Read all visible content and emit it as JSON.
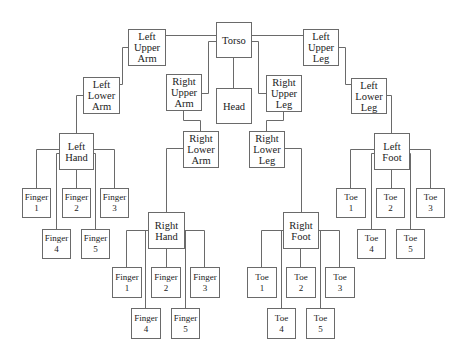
{
  "diagram": {
    "line_color": "#6a6a6a",
    "nodes": {
      "torso": "Torso",
      "head": "Head",
      "left_upper_arm": "Left\nUpper\nArm",
      "left_lower_arm": "Left\nLower\nArm",
      "left_hand": "Left\nHand",
      "left_hand_finger_1": "Finger\n1",
      "left_hand_finger_2": "Finger\n2",
      "left_hand_finger_3": "Finger\n3",
      "left_hand_finger_4": "Finger\n4",
      "left_hand_finger_5": "Finger\n5",
      "right_upper_arm": "Right\nUpper\nArm",
      "right_lower_arm": "Right\nLower\nArm",
      "right_hand": "Right\nHand",
      "right_hand_finger_1": "Finger\n1",
      "right_hand_finger_2": "Finger\n2",
      "right_hand_finger_3": "Finger\n3",
      "right_hand_finger_4": "Finger\n4",
      "right_hand_finger_5": "Finger\n5",
      "right_upper_leg": "Right\nUpper\nLeg",
      "right_lower_leg": "Right\nLower\nLeg",
      "right_foot": "Right\nFoot",
      "right_foot_toe_1": "Toe\n1",
      "right_foot_toe_2": "Toe\n2",
      "right_foot_toe_3": "Toe\n3",
      "right_foot_toe_4": "Toe\n4",
      "right_foot_toe_5": "Toe\n5",
      "left_upper_leg": "Left\nUpper\nLeg",
      "left_lower_leg": "Left\nLower\nLeg",
      "left_foot": "Left\nFoot",
      "left_foot_toe_1": "Toe\n1",
      "left_foot_toe_2": "Toe\n2",
      "left_foot_toe_3": "Toe\n3",
      "left_foot_toe_4": "Toe\n4",
      "left_foot_toe_5": "Toe\n5"
    },
    "edges": [
      [
        "torso",
        "head"
      ],
      [
        "torso",
        "left_upper_arm"
      ],
      [
        "torso",
        "right_upper_arm"
      ],
      [
        "torso",
        "right_upper_leg"
      ],
      [
        "torso",
        "left_upper_leg"
      ],
      [
        "left_upper_arm",
        "left_lower_arm"
      ],
      [
        "left_lower_arm",
        "left_hand"
      ],
      [
        "left_hand",
        "left_hand_finger_1"
      ],
      [
        "left_hand",
        "left_hand_finger_2"
      ],
      [
        "left_hand",
        "left_hand_finger_3"
      ],
      [
        "left_hand",
        "left_hand_finger_4"
      ],
      [
        "left_hand",
        "left_hand_finger_5"
      ],
      [
        "right_upper_arm",
        "right_lower_arm"
      ],
      [
        "right_lower_arm",
        "right_hand"
      ],
      [
        "right_hand",
        "right_hand_finger_1"
      ],
      [
        "right_hand",
        "right_hand_finger_2"
      ],
      [
        "right_hand",
        "right_hand_finger_3"
      ],
      [
        "right_hand",
        "right_hand_finger_4"
      ],
      [
        "right_hand",
        "right_hand_finger_5"
      ],
      [
        "right_upper_leg",
        "right_lower_leg"
      ],
      [
        "right_lower_leg",
        "right_foot"
      ],
      [
        "right_foot",
        "right_foot_toe_1"
      ],
      [
        "right_foot",
        "right_foot_toe_2"
      ],
      [
        "right_foot",
        "right_foot_toe_3"
      ],
      [
        "right_foot",
        "right_foot_toe_4"
      ],
      [
        "right_foot",
        "right_foot_toe_5"
      ],
      [
        "left_upper_leg",
        "left_lower_leg"
      ],
      [
        "left_lower_leg",
        "left_foot"
      ],
      [
        "left_foot",
        "left_foot_toe_1"
      ],
      [
        "left_foot",
        "left_foot_toe_2"
      ],
      [
        "left_foot",
        "left_foot_toe_3"
      ],
      [
        "left_foot",
        "left_foot_toe_4"
      ],
      [
        "left_foot",
        "left_foot_toe_5"
      ]
    ]
  }
}
